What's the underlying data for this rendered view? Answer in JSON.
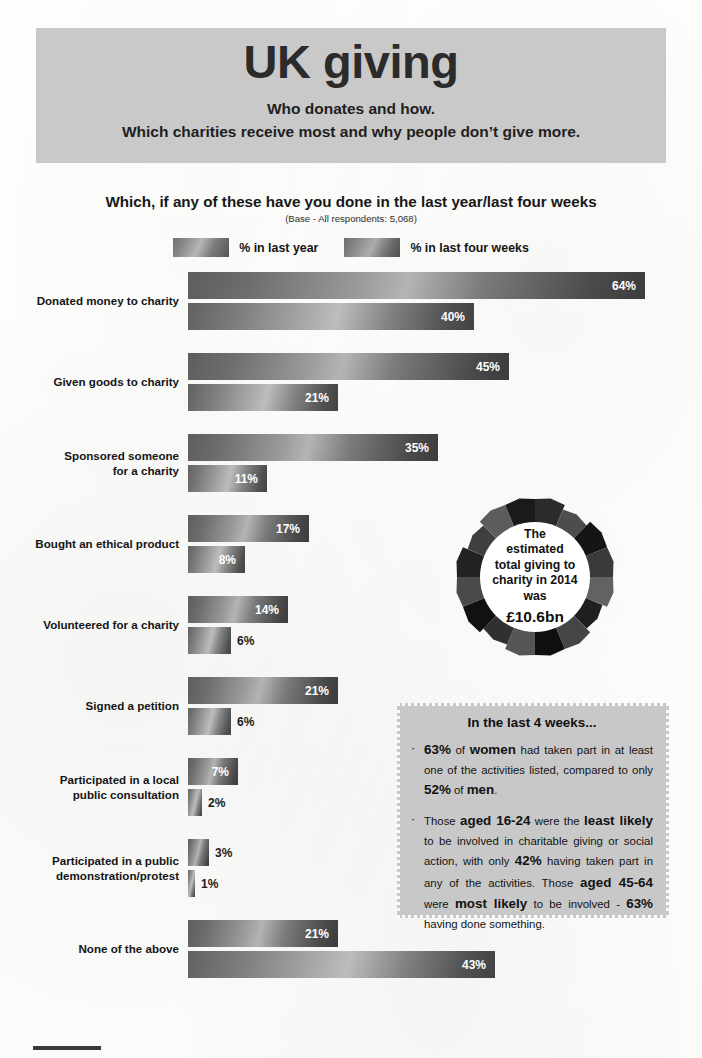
{
  "header": {
    "title": "UK giving",
    "subtitle_line1": "Who donates and how.",
    "subtitle_line2": "Which charities receive most and why people don’t give more."
  },
  "chart_data": {
    "type": "bar",
    "orientation": "horizontal",
    "title": "Which, if any of these have you done in the last year/last four weeks",
    "subtitle": "(Base - All respondents: 5,068)",
    "xlabel": "",
    "ylabel": "",
    "xlim": [
      0,
      64
    ],
    "grid": false,
    "legend_position": "top-center",
    "value_suffix": "%",
    "categories": [
      "Donated money to charity",
      "Given goods to charity",
      "Sponsored someone for a charity",
      "Bought an ethical product",
      "Volunteered for a charity",
      "Signed a petition",
      "Participated in a local public consultation",
      "Participated in a public demonstration/protest",
      "None of the above"
    ],
    "series": [
      {
        "name": "% in last year",
        "values": [
          64,
          45,
          35,
          17,
          14,
          21,
          7,
          3,
          21
        ],
        "labels": [
          "64%",
          "45%",
          "35%",
          "17%",
          "14%",
          "21%",
          "7%",
          "3%",
          "21%"
        ]
      },
      {
        "name": "% in last four weeks",
        "values": [
          40,
          21,
          11,
          8,
          6,
          6,
          2,
          1,
          43
        ],
        "labels": [
          "40%",
          "21%",
          "11%",
          "8%",
          "6%",
          "6%",
          "2%",
          "1%",
          "43%"
        ]
      }
    ]
  },
  "categories_display": [
    {
      "line1": "Donated money to charity",
      "line2": ""
    },
    {
      "line1": "Given goods to charity",
      "line2": ""
    },
    {
      "line1": "Sponsored someone",
      "line2": "for a charity"
    },
    {
      "line1": "Bought an ethical product",
      "line2": ""
    },
    {
      "line1": "Volunteered for a charity",
      "line2": ""
    },
    {
      "line1": "Signed a petition",
      "line2": ""
    },
    {
      "line1": "Participated in a local",
      "line2": "public consultation"
    },
    {
      "line1": "Participated in a public",
      "line2": "demonstration/protest"
    },
    {
      "line1": "None of the above",
      "line2": ""
    }
  ],
  "donut": {
    "line1": "The",
    "line2": "estimated",
    "line3": "total giving to",
    "line4": "charity in 2014",
    "line5": "was",
    "amount": "£10.6bn"
  },
  "callout": {
    "title": "In the last  4 weeks...",
    "bullet_marker": "·",
    "bullets": [
      {
        "parts": [
          {
            "text": "63%",
            "style": "big"
          },
          {
            "text": " of ",
            "style": "normal"
          },
          {
            "text": "women",
            "style": "big"
          },
          {
            "text": " had taken part in at least one of the activities listed, compared to only ",
            "style": "normal"
          },
          {
            "text": "52%",
            "style": "big"
          },
          {
            "text": " of ",
            "style": "normal"
          },
          {
            "text": "men",
            "style": "big"
          },
          {
            "text": ".",
            "style": "normal"
          }
        ]
      },
      {
        "parts": [
          {
            "text": "Those ",
            "style": "normal"
          },
          {
            "text": "aged 16-24",
            "style": "big"
          },
          {
            "text": " were the ",
            "style": "normal"
          },
          {
            "text": "least likely",
            "style": "big"
          },
          {
            "text": " to be involved in charitable giving or social action, with only ",
            "style": "normal"
          },
          {
            "text": "42%",
            "style": "big"
          },
          {
            "text": " having taken part in any of the activities. Those ",
            "style": "normal"
          },
          {
            "text": "aged 45-64",
            "style": "big"
          },
          {
            "text": " were ",
            "style": "normal"
          },
          {
            "text": "most likely",
            "style": "big"
          },
          {
            "text": " to be involved - ",
            "style": "normal"
          },
          {
            "text": "63%",
            "style": "big"
          },
          {
            "text": " having done something.",
            "style": "normal"
          }
        ]
      }
    ]
  },
  "colors": {
    "header_bg": "#c9c9c9",
    "callout_bg": "#c8c8c8",
    "bar_dark": "#4a4a4a",
    "bar_light": "#b4b4b4",
    "text": "#151515",
    "page_bg": "#fdfdfc"
  }
}
